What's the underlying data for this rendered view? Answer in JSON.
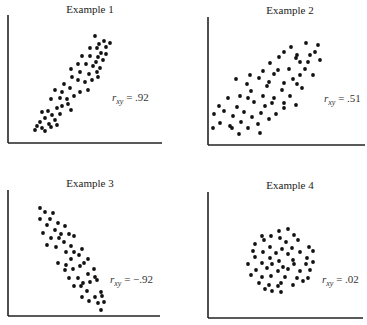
{
  "chart_data": [
    {
      "type": "scatter",
      "title": "Example 1",
      "annotation": "r_xy = .92",
      "r_label": {
        "var": "r",
        "sub": "xy",
        "value": "= .92"
      },
      "correlation": 0.92,
      "xlabel": "",
      "ylabel": "",
      "grid": false,
      "axes": {
        "x0": 8,
        "y0": 143,
        "x1": 162,
        "ytop": 15
      },
      "title_pos": [
        90,
        3
      ],
      "label_pos": [
        112,
        91
      ],
      "points": [
        [
          95,
          36
        ],
        [
          104,
          41
        ],
        [
          99,
          44
        ],
        [
          110,
          43
        ],
        [
          90,
          48
        ],
        [
          97,
          48
        ],
        [
          106,
          47
        ],
        [
          101,
          53
        ],
        [
          106,
          54
        ],
        [
          82,
          56
        ],
        [
          90,
          56
        ],
        [
          98,
          57
        ],
        [
          86,
          64
        ],
        [
          96,
          62
        ],
        [
          103,
          60
        ],
        [
          78,
          64
        ],
        [
          93,
          66
        ],
        [
          100,
          68
        ],
        [
          71,
          69
        ],
        [
          80,
          72
        ],
        [
          89,
          74
        ],
        [
          97,
          72
        ],
        [
          92,
          80
        ],
        [
          85,
          82
        ],
        [
          98,
          77
        ],
        [
          72,
          77
        ],
        [
          64,
          84
        ],
        [
          78,
          80
        ],
        [
          70,
          88
        ],
        [
          62,
          92
        ],
        [
          80,
          92
        ],
        [
          88,
          90
        ],
        [
          74,
          96
        ],
        [
          55,
          90
        ],
        [
          60,
          98
        ],
        [
          67,
          99
        ],
        [
          51,
          99
        ],
        [
          62,
          106
        ],
        [
          68,
          104
        ],
        [
          57,
          108
        ],
        [
          48,
          111
        ],
        [
          42,
          112
        ],
        [
          52,
          115
        ],
        [
          60,
          114
        ],
        [
          71,
          110
        ],
        [
          45,
          118
        ],
        [
          55,
          120
        ],
        [
          40,
          122
        ],
        [
          49,
          124
        ],
        [
          57,
          125
        ],
        [
          37,
          126
        ],
        [
          42,
          128
        ],
        [
          35,
          130
        ],
        [
          45,
          131
        ],
        [
          51,
          127
        ]
      ]
    },
    {
      "type": "scatter",
      "title": "Example 2",
      "annotation": "r_xy = .51",
      "r_label": {
        "var": "r",
        "sub": "xy",
        "value": "= .51"
      },
      "correlation": 0.51,
      "xlabel": "",
      "ylabel": "",
      "grid": false,
      "axes": {
        "x0": 208,
        "y0": 145,
        "x1": 365,
        "ytop": 17
      },
      "title_pos": [
        290,
        4
      ],
      "label_pos": [
        324,
        92
      ],
      "points": [
        [
          306,
          43
        ],
        [
          318,
          45
        ],
        [
          291,
          47
        ],
        [
          315,
          52
        ],
        [
          297,
          55
        ],
        [
          310,
          55
        ],
        [
          279,
          57
        ],
        [
          284,
          52
        ],
        [
          300,
          62
        ],
        [
          320,
          60
        ],
        [
          296,
          58
        ],
        [
          308,
          62
        ],
        [
          270,
          63
        ],
        [
          289,
          69
        ],
        [
          305,
          69
        ],
        [
          278,
          70
        ],
        [
          263,
          71
        ],
        [
          300,
          75
        ],
        [
          313,
          75
        ],
        [
          250,
          75
        ],
        [
          274,
          74
        ],
        [
          259,
          78
        ],
        [
          293,
          79
        ],
        [
          284,
          83
        ],
        [
          297,
          84
        ],
        [
          269,
          82
        ],
        [
          247,
          84
        ],
        [
          236,
          79
        ],
        [
          251,
          91
        ],
        [
          267,
          86
        ],
        [
          282,
          90
        ],
        [
          290,
          96
        ],
        [
          302,
          88
        ],
        [
          263,
          96
        ],
        [
          274,
          98
        ],
        [
          240,
          96
        ],
        [
          248,
          98
        ],
        [
          228,
          98
        ],
        [
          254,
          102
        ],
        [
          272,
          103
        ],
        [
          284,
          103
        ],
        [
          296,
          105
        ],
        [
          265,
          106
        ],
        [
          237,
          107
        ],
        [
          219,
          106
        ],
        [
          244,
          112
        ],
        [
          284,
          108
        ],
        [
          261,
          113
        ],
        [
          224,
          111
        ],
        [
          233,
          116
        ],
        [
          252,
          117
        ],
        [
          276,
          114
        ],
        [
          269,
          119
        ],
        [
          214,
          114
        ],
        [
          241,
          122
        ],
        [
          258,
          124
        ],
        [
          232,
          128
        ],
        [
          248,
          128
        ],
        [
          220,
          123
        ],
        [
          239,
          134
        ],
        [
          213,
          128
        ],
        [
          230,
          126
        ],
        [
          260,
          133
        ]
      ]
    },
    {
      "type": "scatter",
      "title": "Example 3",
      "annotation": "r_xy = -.92",
      "r_label": {
        "var": "r",
        "sub": "xy",
        "value": "= −.92"
      },
      "correlation": -0.92,
      "xlabel": "",
      "ylabel": "",
      "grid": false,
      "axes": {
        "x0": 8,
        "y0": 316,
        "x1": 160,
        "ytop": 190
      },
      "title_pos": [
        90,
        177
      ],
      "label_pos": [
        110,
        273
      ],
      "points": [
        [
          40,
          208
        ],
        [
          45,
          212
        ],
        [
          53,
          213
        ],
        [
          40,
          219
        ],
        [
          50,
          219
        ],
        [
          58,
          223
        ],
        [
          47,
          225
        ],
        [
          65,
          226
        ],
        [
          55,
          230
        ],
        [
          43,
          233
        ],
        [
          61,
          234
        ],
        [
          69,
          234
        ],
        [
          51,
          238
        ],
        [
          59,
          238
        ],
        [
          74,
          236
        ],
        [
          64,
          242
        ],
        [
          47,
          245
        ],
        [
          71,
          246
        ],
        [
          56,
          247
        ],
        [
          66,
          252
        ],
        [
          74,
          252
        ],
        [
          82,
          249
        ],
        [
          79,
          255
        ],
        [
          71,
          259
        ],
        [
          58,
          263
        ],
        [
          88,
          259
        ],
        [
          84,
          263
        ],
        [
          66,
          265
        ],
        [
          73,
          269
        ],
        [
          80,
          266
        ],
        [
          94,
          269
        ],
        [
          88,
          274
        ],
        [
          78,
          278
        ],
        [
          69,
          278
        ],
        [
          83,
          283
        ],
        [
          95,
          277
        ],
        [
          74,
          286
        ],
        [
          81,
          286
        ],
        [
          90,
          282
        ],
        [
          97,
          280
        ],
        [
          87,
          291
        ],
        [
          101,
          292
        ],
        [
          95,
          297
        ],
        [
          82,
          297
        ],
        [
          102,
          296
        ],
        [
          89,
          301
        ],
        [
          98,
          303
        ],
        [
          104,
          302
        ],
        [
          101,
          310
        ],
        [
          65,
          270
        ]
      ]
    },
    {
      "type": "scatter",
      "title": "Example 4",
      "annotation": "r_xy = .02",
      "r_label": {
        "var": "r",
        "sub": "xy",
        "value": "= .02"
      },
      "correlation": 0.02,
      "xlabel": "",
      "ylabel": "",
      "grid": false,
      "axes": {
        "x0": 208,
        "y0": 318,
        "x1": 363,
        "ytop": 192
      },
      "title_pos": [
        290,
        179
      ],
      "label_pos": [
        322,
        273
      ],
      "points": [
        [
          279,
          231
        ],
        [
          288,
          229
        ],
        [
          262,
          236
        ],
        [
          271,
          236
        ],
        [
          294,
          235
        ],
        [
          280,
          238
        ],
        [
          264,
          240
        ],
        [
          286,
          242
        ],
        [
          298,
          240
        ],
        [
          255,
          244
        ],
        [
          270,
          247
        ],
        [
          282,
          249
        ],
        [
          292,
          248
        ],
        [
          309,
          247
        ],
        [
          253,
          251
        ],
        [
          263,
          252
        ],
        [
          276,
          253
        ],
        [
          288,
          254
        ],
        [
          300,
          252
        ],
        [
          313,
          251
        ],
        [
          255,
          257
        ],
        [
          270,
          258
        ],
        [
          279,
          261
        ],
        [
          293,
          260
        ],
        [
          307,
          258
        ],
        [
          248,
          264
        ],
        [
          262,
          263
        ],
        [
          272,
          264
        ],
        [
          283,
          267
        ],
        [
          294,
          264
        ],
        [
          306,
          264
        ],
        [
          313,
          262
        ],
        [
          256,
          270
        ],
        [
          267,
          268
        ],
        [
          278,
          271
        ],
        [
          288,
          269
        ],
        [
          300,
          271
        ],
        [
          310,
          270
        ],
        [
          251,
          275
        ],
        [
          262,
          277
        ],
        [
          271,
          276
        ],
        [
          285,
          277
        ],
        [
          297,
          278
        ],
        [
          308,
          278
        ],
        [
          259,
          283
        ],
        [
          269,
          285
        ],
        [
          281,
          283
        ],
        [
          293,
          285
        ],
        [
          303,
          281
        ],
        [
          272,
          291
        ],
        [
          281,
          292
        ],
        [
          265,
          289
        ],
        [
          278,
          286
        ]
      ]
    }
  ],
  "colors": {
    "dot": "#111111",
    "axis": "#222222",
    "background": "#ffffff"
  }
}
